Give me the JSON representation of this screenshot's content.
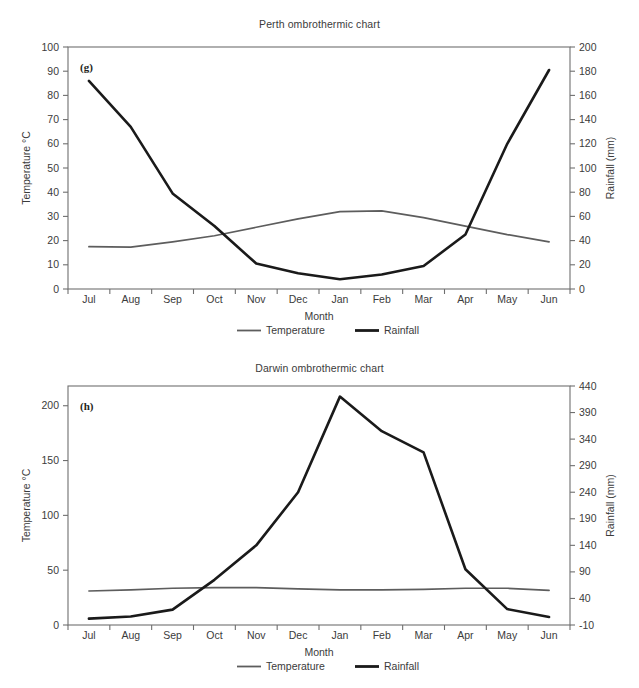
{
  "figure": {
    "background": "#ffffff",
    "temp_color": "#5d5d5d",
    "rain_color": "#1a1a1a",
    "axis_color": "#6f6f6f"
  },
  "charts": [
    {
      "id": "perth",
      "panel_letter": "(g)",
      "title": "Perth ombrothermic chart",
      "xlabel": "Month",
      "y_left_label": "Temperature °C",
      "y_right_label": "Rainfall (mm)",
      "legend": [
        {
          "label": "Temperature",
          "color": "#5d5d5d"
        },
        {
          "label": "Rainfall",
          "color": "#1a1a1a"
        }
      ],
      "y_left_ticks": [
        "0",
        "10",
        "20",
        "30",
        "40",
        "50",
        "60",
        "70",
        "80",
        "90",
        "100"
      ],
      "y_right_ticks": [
        "0",
        "20",
        "40",
        "60",
        "80",
        "100",
        "120",
        "140",
        "160",
        "180",
        "200"
      ],
      "chart_data": {
        "type": "line",
        "title": "Perth ombrothermic chart",
        "xlabel": "Month",
        "ylabel": "Temperature °C",
        "y2label": "Rainfall (mm)",
        "grid": false,
        "legend_position": "bottom",
        "categories": [
          "Jul",
          "Aug",
          "Sep",
          "Oct",
          "Nov",
          "Dec",
          "Jan",
          "Feb",
          "Mar",
          "Apr",
          "May",
          "Jun"
        ],
        "ylim": [
          0,
          100
        ],
        "y2lim": [
          0,
          200
        ],
        "ytick_step": 10,
        "y2tick_step": 20,
        "series": [
          {
            "name": "Temperature",
            "axis": "left",
            "unit": "°C",
            "color": "#5d5d5d",
            "values": [
              17.5,
              17.3,
              19.5,
              22.0,
              25.5,
              29.0,
              32.0,
              32.3,
              29.5,
              26.0,
              22.5,
              19.5
            ]
          },
          {
            "name": "Rainfall",
            "axis": "right",
            "unit": "mm",
            "color": "#1a1a1a",
            "values": [
              172,
              134,
              79,
              52,
              21,
              13,
              8,
              12,
              19,
              45,
              120,
              181
            ]
          }
        ]
      }
    },
    {
      "id": "darwin",
      "panel_letter": "(h)",
      "title": "Darwin ombrothermic chart",
      "xlabel": "Month",
      "y_left_label": "Temperature °C",
      "y_right_label": "Rainfall (mm)",
      "legend": [
        {
          "label": "Temperature",
          "color": "#5d5d5d"
        },
        {
          "label": "Rainfall",
          "color": "#1a1a1a"
        }
      ],
      "y_left_ticks": [
        "0",
        "50",
        "100",
        "150",
        "200"
      ],
      "y_right_ticks": [
        "-10",
        "40",
        "90",
        "140",
        "190",
        "240",
        "290",
        "340",
        "390",
        "440"
      ],
      "chart_data": {
        "type": "line",
        "title": "Darwin ombrothermic chart",
        "xlabel": "Month",
        "ylabel": "Temperature °C",
        "y2label": "Rainfall (mm)",
        "grid": false,
        "legend_position": "bottom",
        "categories": [
          "Jul",
          "Aug",
          "Sep",
          "Oct",
          "Nov",
          "Dec",
          "Jan",
          "Feb",
          "Mar",
          "Apr",
          "May",
          "Jun"
        ],
        "ylim": [
          0,
          218
        ],
        "y2lim": [
          -10,
          440
        ],
        "ytick_step": 50,
        "y2tick_step": 50,
        "series": [
          {
            "name": "Temperature",
            "axis": "left",
            "unit": "°C",
            "color": "#5d5d5d",
            "values": [
              31.0,
              32.0,
              33.5,
              34.0,
              34.0,
              33.0,
              32.0,
              32.0,
              32.5,
              33.5,
              33.5,
              31.5
            ]
          },
          {
            "name": "Rainfall",
            "axis": "right",
            "unit": "mm",
            "color": "#1a1a1a",
            "values": [
              2,
              6,
              19,
              75,
              140,
              240,
              420,
              355,
              315,
              95,
              20,
              5
            ]
          }
        ]
      }
    }
  ]
}
